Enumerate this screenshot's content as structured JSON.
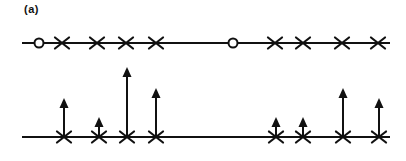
{
  "figure": {
    "label": "(a)"
  },
  "colors": {
    "stroke": "#111111",
    "background": "#ffffff"
  },
  "diagram": {
    "width": 406,
    "height": 161,
    "axis_line_width": 2,
    "marker_stroke_width": 2.2,
    "x_marker_half_width": 7,
    "x_marker_half_height": 5.5,
    "circle_radius": 4.5,
    "circle_stroke_width": 2,
    "arrow_shaft_width": 2,
    "arrow_head_width": 9,
    "arrow_head_height": 10,
    "top_row": {
      "y": 43,
      "x_start": 22,
      "x_end": 390,
      "markers": [
        {
          "type": "circle",
          "x": 39
        },
        {
          "type": "x",
          "x": 62
        },
        {
          "type": "x",
          "x": 97
        },
        {
          "type": "x",
          "x": 126
        },
        {
          "type": "x",
          "x": 156
        },
        {
          "type": "circle",
          "x": 233
        },
        {
          "type": "x",
          "x": 275
        },
        {
          "type": "x",
          "x": 303
        },
        {
          "type": "x",
          "x": 342
        },
        {
          "type": "x",
          "x": 378
        }
      ]
    },
    "bottom_row": {
      "y": 137,
      "x_start": 22,
      "x_end": 390,
      "impulses": [
        {
          "x": 64,
          "height": 39
        },
        {
          "x": 99,
          "height": 20
        },
        {
          "x": 127,
          "height": 70
        },
        {
          "x": 156,
          "height": 49
        },
        {
          "x": 276,
          "height": 20
        },
        {
          "x": 303,
          "height": 20
        },
        {
          "x": 343,
          "height": 49
        },
        {
          "x": 379,
          "height": 39
        }
      ]
    }
  }
}
